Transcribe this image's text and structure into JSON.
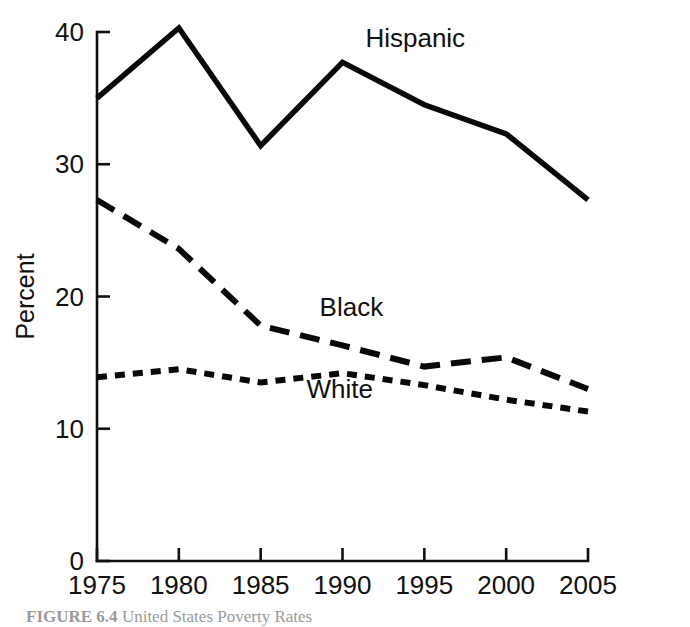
{
  "figure": {
    "caption_prefix": "FIGURE 6.4",
    "caption_text": "United States Poverty Rates",
    "background_color": "#ffffff",
    "ink_color": "#101010"
  },
  "chart_data": {
    "type": "line",
    "title": "",
    "xlabel": "",
    "ylabel": "Percent",
    "x": [
      1975,
      1980,
      1985,
      1990,
      1995,
      2000,
      2005
    ],
    "categories": [
      "1975",
      "1980",
      "1985",
      "1990",
      "1995",
      "2000",
      "2005"
    ],
    "xlim": [
      1975,
      2005
    ],
    "ylim": [
      0,
      40
    ],
    "yticks": [
      0,
      10,
      20,
      30,
      40
    ],
    "ytick_labels": [
      "0",
      "10",
      "20",
      "30",
      "40"
    ],
    "xticks": [
      1975,
      1980,
      1985,
      1990,
      1995,
      2000,
      2005
    ],
    "xtick_labels": [
      "1975",
      "1980",
      "1985",
      "1990",
      "1995",
      "2000",
      "2005"
    ],
    "grid": false,
    "legend": "inline-labels",
    "series": [
      {
        "name": "Hispanic",
        "label": "Hispanic",
        "values": [
          35.0,
          40.3,
          31.4,
          37.7,
          34.5,
          32.3,
          27.3
        ],
        "style": "solid",
        "color": "#080808",
        "stroke_width": 5.5,
        "dasharray": "none",
        "label_x": 1991.4,
        "label_y": 38.9
      },
      {
        "name": "Black",
        "label": "Black",
        "values": [
          27.3,
          23.6,
          17.8,
          16.3,
          14.7,
          15.4,
          13.0
        ],
        "style": "long-dash",
        "color": "#080808",
        "stroke_width": 6.0,
        "dasharray": "20 11",
        "label_x": 1988.6,
        "label_y": 18.5
      },
      {
        "name": "White",
        "label": "White",
        "values": [
          13.9,
          14.5,
          13.5,
          14.2,
          13.3,
          12.2,
          11.3
        ],
        "style": "short-dash",
        "color": "#080808",
        "stroke_width": 6.0,
        "dasharray": "10 8",
        "label_x": 1987.8,
        "label_y": 12.3
      }
    ]
  },
  "plot_geometry": {
    "left_px": 97,
    "right_px": 588,
    "top_px": 32,
    "bottom_px": 561,
    "tick_length_px": 13
  }
}
